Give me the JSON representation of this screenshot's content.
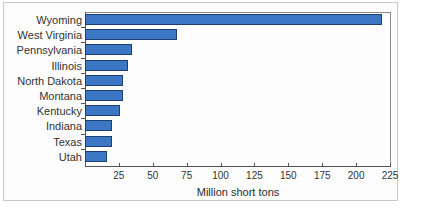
{
  "chart_data": {
    "type": "bar",
    "orientation": "horizontal",
    "title": "",
    "xlabel": "Million short tons",
    "ylabel": "",
    "xlim": [
      0,
      225
    ],
    "xticks": [
      25,
      50,
      75,
      100,
      125,
      150,
      175,
      200,
      225
    ],
    "grid": false,
    "legend": null,
    "bar_color": "#3b77c4",
    "bar_edge_color": "#1f3f70",
    "categories": [
      "Wyoming",
      "West Virginia",
      "Pennsylvania",
      "Illinois",
      "North Dakota",
      "Montana",
      "Kentucky",
      "Indiana",
      "Texas",
      "Utah"
    ],
    "values": [
      219,
      68,
      35,
      32,
      28,
      28,
      26,
      20,
      20,
      16
    ]
  }
}
